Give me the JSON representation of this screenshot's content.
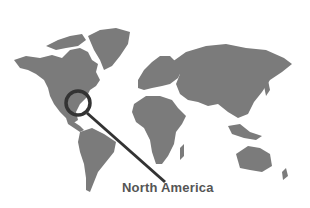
{
  "image": {
    "description": "World map silhouette with magnifying glass over North America",
    "land_color": "#7b7b7b",
    "background_color": "#ffffff",
    "magnifier_color": "#333333"
  },
  "label": {
    "text": "North America"
  }
}
